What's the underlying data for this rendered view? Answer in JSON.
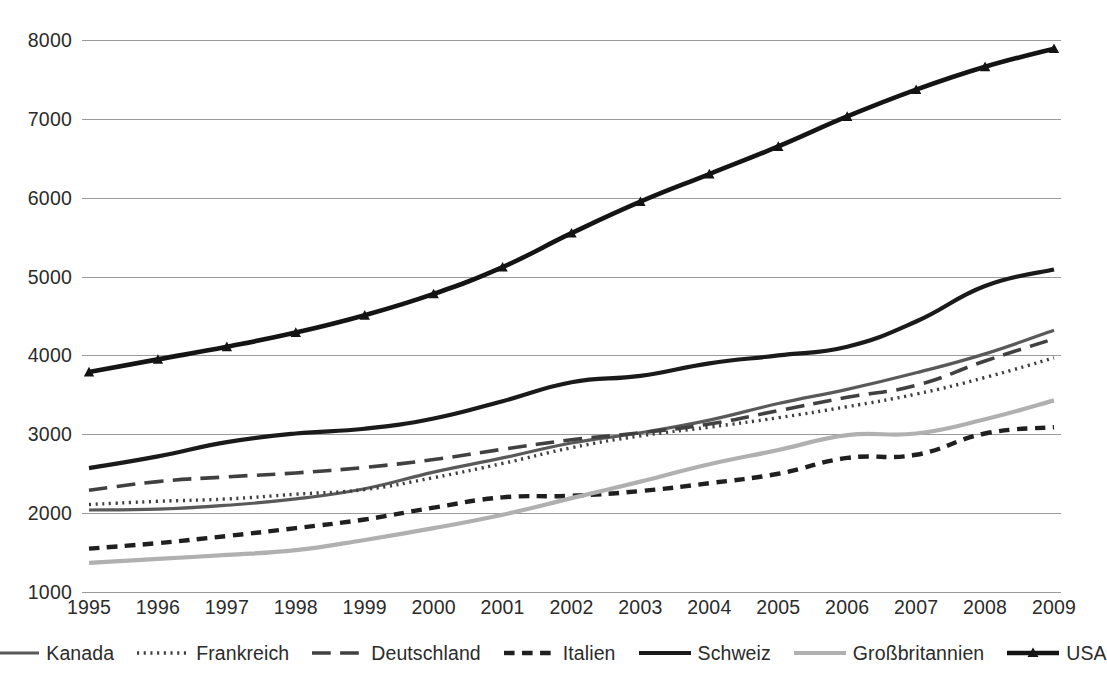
{
  "chart_data": {
    "type": "line",
    "title": "",
    "subtitle": "",
    "xlabel": "",
    "ylabel": "",
    "x": [
      1995,
      1996,
      1997,
      1998,
      1999,
      2000,
      2001,
      2002,
      2003,
      2004,
      2005,
      2006,
      2007,
      2008,
      2009
    ],
    "xlim": [
      1995,
      2009
    ],
    "ylim": [
      1000,
      8000
    ],
    "y_ticks": [
      1000,
      2000,
      3000,
      4000,
      5000,
      6000,
      7000,
      8000
    ],
    "x_tick_labels": [
      "1995",
      "1996",
      "1997",
      "1998",
      "1999",
      "2000",
      "2001",
      "2002",
      "2003",
      "2004",
      "2005",
      "2006",
      "2007",
      "2008",
      "2009"
    ],
    "y_tick_labels": [
      "8000",
      "7000",
      "6000",
      "5000",
      "4000",
      "3000",
      "2000",
      "1000"
    ],
    "grid": true,
    "grid_axis": "y",
    "legend_position": "bottom",
    "series": [
      {
        "name": "Kanada",
        "values": [
          2040,
          2050,
          2100,
          2180,
          2310,
          2520,
          2700,
          2890,
          3020,
          3180,
          3390,
          3570,
          3780,
          4020,
          4320
        ],
        "color": "#595959",
        "style": "solid",
        "width": 3.2,
        "marker": "none"
      },
      {
        "name": "Frankreich",
        "values": [
          2110,
          2150,
          2180,
          2240,
          2300,
          2450,
          2630,
          2830,
          2980,
          3090,
          3210,
          3350,
          3510,
          3720,
          3970
        ],
        "color": "#3f3f3f",
        "style": "dotted",
        "width": 3.4,
        "marker": "none"
      },
      {
        "name": "Deutschland",
        "values": [
          2290,
          2400,
          2460,
          2510,
          2580,
          2680,
          2810,
          2930,
          3020,
          3130,
          3300,
          3470,
          3620,
          3930,
          4210
        ],
        "color": "#404040",
        "style": "dashed-long",
        "width": 3.6,
        "marker": "none"
      },
      {
        "name": "Italien",
        "values": [
          1550,
          1620,
          1710,
          1810,
          1920,
          2070,
          2200,
          2220,
          2280,
          2380,
          2500,
          2700,
          2740,
          3010,
          3090
        ],
        "color": "#1f1f1f",
        "style": "dashed-short",
        "width": 4.4,
        "marker": "none"
      },
      {
        "name": "Schweiz",
        "values": [
          2570,
          2720,
          2900,
          3010,
          3070,
          3200,
          3420,
          3660,
          3740,
          3900,
          4000,
          4110,
          4430,
          4880,
          5090
        ],
        "color": "#1a1a1a",
        "style": "solid",
        "width": 4.2,
        "marker": "none"
      },
      {
        "name": "Großbritannien",
        "values": [
          1370,
          1420,
          1470,
          1530,
          1660,
          1810,
          1980,
          2190,
          2400,
          2620,
          2800,
          2990,
          3010,
          3190,
          3430
        ],
        "color": "#b0b0b0",
        "style": "solid",
        "width": 4.2,
        "marker": "none"
      },
      {
        "name": "USA",
        "values": [
          3790,
          3950,
          4110,
          4290,
          4510,
          4780,
          5120,
          5550,
          5950,
          6300,
          6650,
          7030,
          7370,
          7660,
          7890
        ],
        "color": "#141414",
        "style": "solid",
        "width": 4.6,
        "marker": "triangle"
      }
    ]
  },
  "legend": {
    "items": [
      {
        "label": "Kanada",
        "swatch": "line-solid-gray"
      },
      {
        "label": "Frankreich",
        "swatch": "line-dotted"
      },
      {
        "label": "Deutschland",
        "swatch": "line-dashed-long"
      },
      {
        "label": "Italien",
        "swatch": "line-dashed-short"
      },
      {
        "label": "Schweiz",
        "swatch": "line-solid-black-thick"
      },
      {
        "label": "Großbritannien",
        "swatch": "line-solid-lightgray"
      },
      {
        "label": "USA",
        "swatch": "line-solid-black-triangle"
      }
    ]
  },
  "colors": {
    "background": "#ffffff",
    "gridline": "#9b9b9b",
    "tick_text": "#2b2b2b"
  }
}
